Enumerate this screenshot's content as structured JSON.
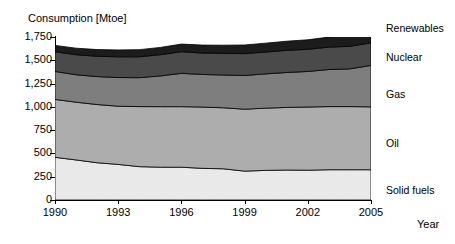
{
  "chart_data": {
    "type": "area",
    "stacked": true,
    "title": "",
    "ylabel": "Consumption [Mtoe]",
    "xlabel": "Year",
    "ylim": [
      0,
      1750
    ],
    "xlim": [
      1990,
      2005
    ],
    "grid": false,
    "legend_position": "right",
    "ytick_labels": [
      "1,750",
      "1,500",
      "1,250",
      "1,000",
      "750",
      "500",
      "250",
      "0"
    ],
    "ytick_values": [
      1750,
      1500,
      1250,
      1000,
      750,
      500,
      250,
      0
    ],
    "xtick_labels": [
      "1990",
      "1993",
      "1996",
      "1999",
      "2002",
      "2005"
    ],
    "xtick_values": [
      1990,
      1993,
      1996,
      1999,
      2002,
      2005
    ],
    "x": [
      1990,
      1991,
      1992,
      1993,
      1994,
      1995,
      1996,
      1997,
      1998,
      1999,
      2000,
      2001,
      2002,
      2003,
      2004,
      2005
    ],
    "series": [
      {
        "name": "Solid fuels",
        "color": "#e9e9e9",
        "values": [
          458,
          430,
          400,
          382,
          358,
          352,
          352,
          340,
          335,
          310,
          318,
          322,
          320,
          325,
          325,
          325
        ]
      },
      {
        "name": "Oil",
        "color": "#adadad",
        "values": [
          622,
          620,
          625,
          625,
          645,
          650,
          650,
          658,
          655,
          665,
          668,
          672,
          678,
          678,
          678,
          675
        ]
      },
      {
        "name": "Gas",
        "color": "#7e7e7e",
        "values": [
          300,
          295,
          300,
          308,
          310,
          330,
          358,
          350,
          352,
          362,
          368,
          375,
          382,
          398,
          405,
          445
        ]
      },
      {
        "name": "Nuclear",
        "color": "#4a4a4a",
        "values": [
          212,
          215,
          218,
          222,
          225,
          228,
          232,
          230,
          232,
          235,
          235,
          238,
          238,
          240,
          242,
          242
        ]
      },
      {
        "name": "Renewables",
        "color": "#1c1c1c",
        "values": [
          68,
          70,
          72,
          74,
          76,
          78,
          82,
          85,
          88,
          92,
          95,
          98,
          102,
          108,
          115,
          125
        ]
      }
    ],
    "legend_entries": [
      {
        "label": "Renewables",
        "color": "#1c1c1c"
      },
      {
        "label": "Nuclear",
        "color": "#4a4a4a"
      },
      {
        "label": "Gas",
        "color": "#7e7e7e"
      },
      {
        "label": "Oil",
        "color": "#adadad"
      },
      {
        "label": "Solid fuels",
        "color": "#e9e9e9"
      }
    ],
    "legend_label_y": [
      22,
      51,
      88,
      137,
      184
    ]
  }
}
